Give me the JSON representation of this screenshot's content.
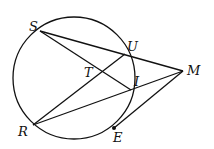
{
  "diagram": {
    "type": "circle-secant-geometry",
    "circle": {
      "cx": 74,
      "cy": 78,
      "r": 61
    },
    "points": {
      "S": {
        "label": "S",
        "x": 40,
        "y": 31
      },
      "U": {
        "label": "U",
        "x": 125,
        "y": 54
      },
      "I": {
        "label": "I",
        "x": 131,
        "y": 90
      },
      "R": {
        "label": "R",
        "x": 33,
        "y": 125
      },
      "E": {
        "label": "E",
        "x": 114,
        "y": 128
      },
      "M": {
        "label": "M",
        "x": 183,
        "y": 71
      },
      "T": {
        "label": "T",
        "x": 102,
        "y": 72
      }
    },
    "segments": [
      [
        "S",
        "M"
      ],
      [
        "S",
        "I"
      ],
      [
        "R",
        "U"
      ],
      [
        "R",
        "M"
      ],
      [
        "E",
        "M"
      ]
    ],
    "stroke_color": "#111111"
  }
}
